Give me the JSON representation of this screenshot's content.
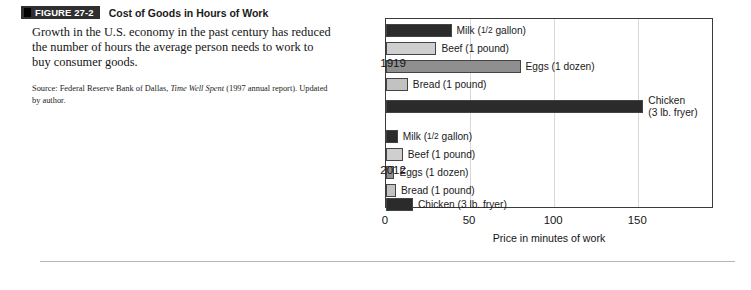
{
  "figure": {
    "badge": "FIGURE 27-2",
    "title": "Cost of Goods in Hours of Work",
    "caption": "Growth in the U.S. economy in the past century has reduced the number of hours the average person needs to work to buy consumer goods.",
    "source_prefix": "Source: Federal Reserve Bank of Dallas, ",
    "source_italic": "Time Well Spent",
    "source_suffix": " (1997 annual report). Updated by author."
  },
  "colors": {
    "bar_dark": "#2b2b2b",
    "bar_light": "#cfcfcf",
    "bar_medium": "#8f8f8f",
    "bar_lighter": "#c2c2c2",
    "frame": "#3b3b3b",
    "gridline": "#d8d8d8",
    "badge_bg": "#2f2f2f"
  },
  "chart_data": {
    "type": "bar",
    "orientation": "horizontal",
    "title": "Cost of Goods in Hours of Work",
    "xlabel": "Price in minutes of work",
    "ylabel": "",
    "xlim": [
      0,
      195
    ],
    "xticks": [
      0,
      50,
      100,
      150
    ],
    "xtick_labels": [
      "0",
      "50",
      "100",
      "150"
    ],
    "grid": true,
    "grid_axis": "x",
    "legend": "inline-labels",
    "groups": [
      "1919",
      "2012"
    ],
    "categories": [
      "Milk (1/2 gallon)",
      "Beef (1 pound)",
      "Eggs (1 dozen)",
      "Bread (1 pound)",
      "Chicken (3 lb. fryer)"
    ],
    "series": [
      {
        "name": "1919",
        "values": [
          39,
          30,
          80,
          13,
          153
        ]
      },
      {
        "name": "2012",
        "values": [
          7,
          10,
          5,
          6,
          16
        ]
      }
    ],
    "bars": [
      {
        "group": "1919",
        "label": "Milk (1/2 gallon)",
        "label_pre": "Milk (",
        "label_frac": "1/2",
        "label_post": " gallon)",
        "value": 39,
        "color": "bar_dark",
        "two_line": false
      },
      {
        "group": "1919",
        "label": "Beef (1 pound)",
        "value": 30,
        "color": "bar_light",
        "two_line": false
      },
      {
        "group": "1919",
        "label": "Eggs (1 dozen)",
        "value": 80,
        "color": "bar_medium",
        "two_line": false
      },
      {
        "group": "1919",
        "label": "Bread (1 pound)",
        "value": 13,
        "color": "bar_lighter",
        "two_line": false
      },
      {
        "group": "1919",
        "label": "Chicken\n(3 lb. fryer)",
        "value": 153,
        "color": "bar_dark",
        "two_line": true
      },
      {
        "group": "2012",
        "label": "Milk (1/2 gallon)",
        "label_pre": "Milk (",
        "label_frac": "1/2",
        "label_post": " gallon)",
        "value": 7,
        "color": "bar_dark",
        "two_line": false
      },
      {
        "group": "2012",
        "label": "Beef (1 pound)",
        "value": 10,
        "color": "bar_light",
        "two_line": false
      },
      {
        "group": "2012",
        "label": "Eggs (1 dozen)",
        "value": 5,
        "color": "bar_medium",
        "two_line": false
      },
      {
        "group": "2012",
        "label": "Bread (1 pound)",
        "value": 6,
        "color": "bar_lighter",
        "two_line": false
      },
      {
        "group": "2012",
        "label": "Chicken (3 lb. fryer)",
        "value": 16,
        "color": "bar_dark",
        "two_line": false
      }
    ]
  }
}
